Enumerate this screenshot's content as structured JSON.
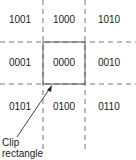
{
  "diagram": {
    "regions": [
      {
        "code": "1001",
        "row": 0,
        "col": 0
      },
      {
        "code": "1000",
        "row": 0,
        "col": 1
      },
      {
        "code": "1010",
        "row": 0,
        "col": 2
      },
      {
        "code": "0001",
        "row": 1,
        "col": 0
      },
      {
        "code": "0000",
        "row": 1,
        "col": 1
      },
      {
        "code": "0010",
        "row": 1,
        "col": 2
      },
      {
        "code": "0101",
        "row": 2,
        "col": 0
      },
      {
        "code": "0100",
        "row": 2,
        "col": 1
      },
      {
        "code": "0110",
        "row": 2,
        "col": 2
      }
    ],
    "annotation": {
      "line1": "Clip",
      "line2": "rectangle"
    },
    "colors": {
      "line": "#666666",
      "text": "#222222"
    }
  }
}
